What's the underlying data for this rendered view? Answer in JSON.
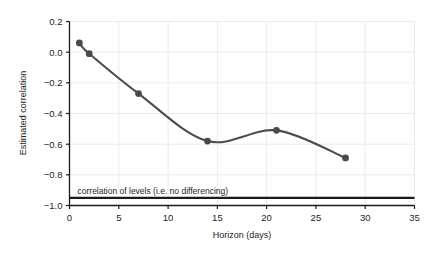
{
  "chart_data": {
    "type": "line",
    "title": "",
    "xlabel": "Horizon (days)",
    "ylabel": "Estimated correlation",
    "x": [
      1,
      2,
      7,
      14,
      21,
      28
    ],
    "values": [
      0.06,
      -0.01,
      -0.27,
      -0.58,
      -0.51,
      -0.69
    ],
    "series": [
      {
        "name": "Estimated correlation",
        "x": [
          1,
          2,
          7,
          14,
          21,
          28
        ],
        "values": [
          0.06,
          -0.01,
          -0.27,
          -0.58,
          -0.51,
          -0.69
        ]
      }
    ],
    "xlim": [
      0,
      35
    ],
    "ylim": [
      -1.0,
      0.2
    ],
    "xticks": [
      0,
      5,
      10,
      15,
      20,
      25,
      30,
      35
    ],
    "xtick_labels": [
      "0",
      "5",
      "10",
      "15",
      "20",
      "25",
      "30",
      "35"
    ],
    "yticks": [
      0.2,
      0.0,
      -0.2,
      -0.4,
      -0.6,
      -0.8,
      -1.0
    ],
    "ytick_labels": [
      "0.2",
      "0.0",
      "−0.2",
      "−0.4",
      "−0.6",
      "−0.8",
      "−1.0"
    ],
    "grid": true,
    "legend": "none",
    "annotations": [
      {
        "name": "reference-line",
        "text": "correlation of levels (i.e. no differencing)",
        "y": -0.95,
        "type": "hline"
      }
    ],
    "marker": "circle",
    "line_color": "#4d4d4d",
    "marker_color": "#4a4a4a",
    "reference_line_color": "#1a1a1a",
    "grid_color": "#e6e6ee",
    "axis_color": "#1a1a1a"
  },
  "axes": {
    "ylabel_text": "Estimated correlation",
    "xlabel_text": "Horizon (days)"
  },
  "ticks": {
    "y": [
      {
        "label": "0.2",
        "value": 0.2
      },
      {
        "label": "0.0",
        "value": 0.0
      },
      {
        "label": "−0.2",
        "value": -0.2
      },
      {
        "label": "−0.4",
        "value": -0.4
      },
      {
        "label": "−0.6",
        "value": -0.6
      },
      {
        "label": "−0.8",
        "value": -0.8
      },
      {
        "label": "−1.0",
        "value": -1.0
      }
    ],
    "x": [
      {
        "label": "0",
        "value": 0
      },
      {
        "label": "5",
        "value": 5
      },
      {
        "label": "10",
        "value": 10
      },
      {
        "label": "15",
        "value": 15
      },
      {
        "label": "20",
        "value": 20
      },
      {
        "label": "25",
        "value": 25
      },
      {
        "label": "30",
        "value": 30
      },
      {
        "label": "35",
        "value": 35
      }
    ]
  },
  "annotation": {
    "reference_label": "correlation of levels (i.e. no differencing)"
  }
}
